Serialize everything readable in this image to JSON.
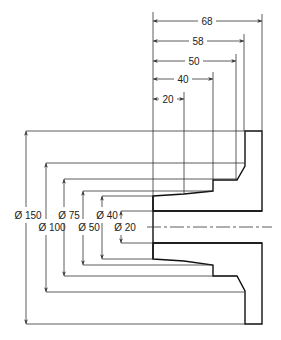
{
  "drawing": {
    "title": "Flanged bush section with dimensions",
    "colors": {
      "line": "#111111",
      "dim": "#333333",
      "background": "#ffffff"
    },
    "length_dimensions": [
      {
        "label": "68",
        "y": 21,
        "x1": 153,
        "x2": 262,
        "text_x": 207
      },
      {
        "label": "58",
        "y": 41,
        "x1": 153,
        "x2": 244,
        "text_x": 198
      },
      {
        "label": "50",
        "y": 61,
        "x1": 153,
        "x2": 236,
        "text_x": 194
      },
      {
        "label": "40",
        "y": 79,
        "x1": 153,
        "x2": 213,
        "text_x": 183
      },
      {
        "label": "20",
        "y": 99,
        "x1": 153,
        "x2": 184,
        "text_x": 168
      }
    ],
    "diameter_dimensions": [
      {
        "label": "Ø 150",
        "x": 26,
        "y1": 131,
        "y2": 324,
        "text_x": 28,
        "text_y": 219
      },
      {
        "label": "Ø 100",
        "x": 46,
        "y1": 163,
        "y2": 292,
        "text_x": 52,
        "text_y": 231
      },
      {
        "label": "Ø 75",
        "x": 64,
        "y1": 179,
        "y2": 276,
        "text_x": 69,
        "text_y": 219
      },
      {
        "label": "Ø 50",
        "x": 83,
        "y1": 191,
        "y2": 265,
        "text_x": 89,
        "text_y": 231
      },
      {
        "label": "Ø 40",
        "x": 102,
        "y1": 196,
        "y2": 259,
        "text_x": 107,
        "text_y": 219
      },
      {
        "label": "Ø 20",
        "x": 121,
        "y1": 211,
        "y2": 243,
        "text_x": 125,
        "text_y": 231
      }
    ]
  }
}
